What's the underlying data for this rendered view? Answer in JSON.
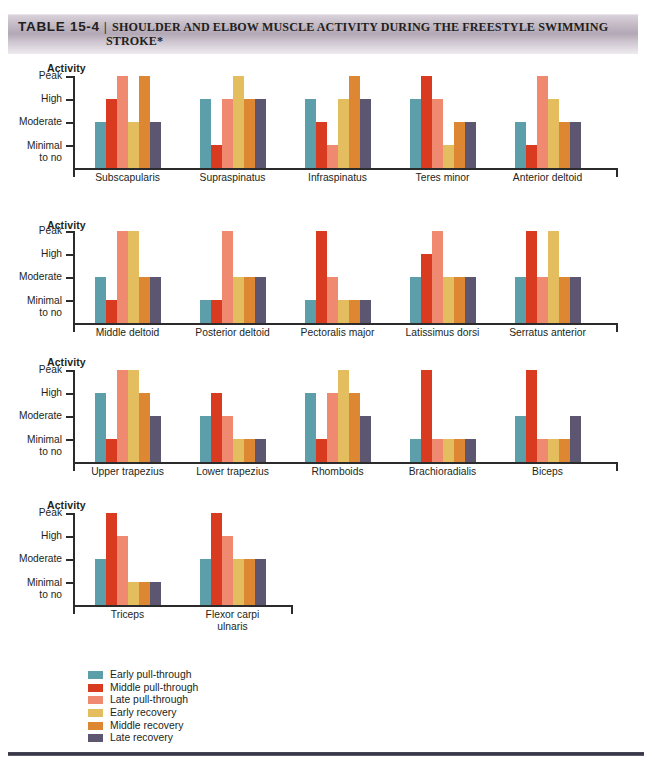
{
  "header": {
    "table_number": "TABLE 15-4",
    "separator": "|",
    "title_line1": "SHOULDER AND ELBOW MUSCLE ACTIVITY DURING THE FREESTYLE SWIMMING",
    "title_line2": "STROKE*"
  },
  "axis": {
    "title": "Activity",
    "ticks": [
      "Peak",
      "High",
      "Moderate",
      "Minimal\nto no"
    ],
    "tick_peak": "Peak",
    "tick_high": "High",
    "tick_moderate": "Moderate",
    "tick_minimal_l1": "Minimal",
    "tick_minimal_l2": "to no"
  },
  "legend": {
    "items": [
      {
        "label": "Early pull-through",
        "color": "#5c9fab"
      },
      {
        "label": "Middle pull-through",
        "color": "#d93b21"
      },
      {
        "label": "Late pull-through",
        "color": "#ef8a70"
      },
      {
        "label": "Early recovery",
        "color": "#e3bd5e"
      },
      {
        "label": "Middle recovery",
        "color": "#dd8732"
      },
      {
        "label": "Late recovery",
        "color": "#5d5670"
      }
    ]
  },
  "chart_data": {
    "type": "bar",
    "ylabel": "Activity",
    "grid": false,
    "legend_position": "bottom-left",
    "scale_labels": [
      "Minimal to no",
      "Moderate",
      "High",
      "Peak"
    ],
    "scale_values": [
      1,
      2,
      3,
      4
    ],
    "ylim": [
      0,
      4
    ],
    "series": [
      {
        "name": "Early pull-through",
        "color": "#5c9fab"
      },
      {
        "name": "Middle pull-through",
        "color": "#d93b21"
      },
      {
        "name": "Late pull-through",
        "color": "#ef8a70"
      },
      {
        "name": "Early recovery",
        "color": "#e3bd5e"
      },
      {
        "name": "Middle recovery",
        "color": "#dd8732"
      },
      {
        "name": "Late recovery",
        "color": "#5d5670"
      }
    ],
    "rows": [
      {
        "row": 1,
        "groups": [
          {
            "label": "Subscapularis",
            "values": [
              2,
              3,
              4,
              2,
              4,
              2
            ]
          },
          {
            "label": "Supraspinatus",
            "values": [
              3,
              1,
              3,
              4,
              3,
              3
            ]
          },
          {
            "label": "Infraspinatus",
            "values": [
              3,
              2,
              1,
              3,
              4,
              3
            ]
          },
          {
            "label": "Teres minor",
            "values": [
              3,
              4,
              3,
              1,
              2,
              2
            ]
          },
          {
            "label": "Anterior deltoid",
            "values": [
              2,
              1,
              4,
              3,
              2,
              2
            ]
          }
        ]
      },
      {
        "row": 2,
        "groups": [
          {
            "label": "Middle deltoid",
            "values": [
              2,
              1,
              4,
              4,
              2,
              2
            ]
          },
          {
            "label": "Posterior deltoid",
            "values": [
              1,
              1,
              4,
              2,
              2,
              2
            ]
          },
          {
            "label": "Pectoralis major",
            "values": [
              1,
              4,
              2,
              1,
              1,
              1
            ]
          },
          {
            "label": "Latissimus dorsi",
            "values": [
              2,
              3,
              4,
              2,
              2,
              2
            ]
          },
          {
            "label": "Serratus anterior",
            "values": [
              2,
              4,
              2,
              4,
              2,
              2
            ]
          }
        ]
      },
      {
        "row": 3,
        "groups": [
          {
            "label": "Upper trapezius",
            "values": [
              3,
              1,
              4,
              4,
              3,
              2
            ]
          },
          {
            "label": "Lower trapezius",
            "values": [
              2,
              3,
              2,
              1,
              1,
              1
            ]
          },
          {
            "label": "Rhomboids",
            "values": [
              3,
              1,
              3,
              4,
              3,
              2
            ]
          },
          {
            "label": "Brachioradialis",
            "values": [
              1,
              4,
              1,
              1,
              1,
              1
            ]
          },
          {
            "label": "Biceps",
            "values": [
              2,
              4,
              1,
              1,
              1,
              2
            ]
          }
        ]
      },
      {
        "row": 4,
        "groups": [
          {
            "label": "Triceps",
            "values": [
              2,
              4,
              3,
              1,
              1,
              1
            ]
          },
          {
            "label": "Flexor carpi\nulnaris",
            "values": [
              2,
              4,
              3,
              2,
              2,
              2
            ]
          }
        ]
      }
    ]
  }
}
